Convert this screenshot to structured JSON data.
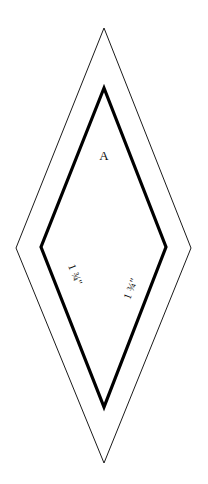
{
  "canvas": {
    "width": 208,
    "height": 484,
    "background_color": "#ffffff"
  },
  "shape": {
    "kind": "nested-diamond-template",
    "description": "Quilting diamond pattern piece with outer cutting line and inner bold stitching line",
    "outer": {
      "name": "cutting-line",
      "stroke_color": "#1a1a1a",
      "stroke_width": 1,
      "fill": "none",
      "points": "104,28 191,248 104,463 16,248",
      "vertices": {
        "top": [
          104,
          28
        ],
        "right": [
          191,
          248
        ],
        "bottom": [
          104,
          463
        ],
        "left": [
          16,
          248
        ]
      }
    },
    "inner": {
      "name": "stitching-line",
      "stroke_color": "#000000",
      "stroke_width": 3.2,
      "fill": "none",
      "points": "104,88 166,247 104,407 41,247",
      "vertices": {
        "top": [
          104,
          88
        ],
        "right": [
          166,
          247
        ],
        "bottom": [
          104,
          407
        ],
        "left": [
          41,
          247
        ]
      }
    }
  },
  "labels": {
    "piece_letter": "A",
    "piece_letter_pos": {
      "x": 104,
      "y": 160
    },
    "left_measurement": {
      "text": "1 ¾\"",
      "x": 72,
      "y": 276,
      "rotation": 69
    },
    "right_measurement": {
      "text": "1 ¾\"",
      "x": 134,
      "y": 290,
      "rotation": -69
    }
  }
}
